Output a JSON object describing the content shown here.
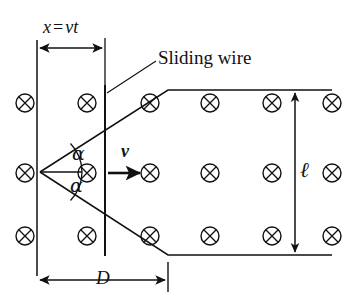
{
  "figure": {
    "background_color": "#ffffff",
    "line_color": "#111111"
  },
  "labels": {
    "sliding_wire": "Sliding wire",
    "displacement_symbol": "x",
    "displacement_equals": "=",
    "displacement_value": "vt",
    "angle_upper": "α",
    "angle_lower": "α",
    "velocity": "v",
    "length": "ℓ",
    "separation": "D"
  },
  "field": {
    "symbol": "⊗",
    "meaning": "magnetic-field-into-page",
    "rows": 3,
    "columns": 6,
    "marker_radius": 9,
    "positions": [
      {
        "x": 25,
        "y": 103
      },
      {
        "x": 87,
        "y": 103
      },
      {
        "x": 150,
        "y": 103
      },
      {
        "x": 210,
        "y": 103
      },
      {
        "x": 272,
        "y": 103
      },
      {
        "x": 332,
        "y": 103
      },
      {
        "x": 25,
        "y": 173
      },
      {
        "x": 87,
        "y": 173
      },
      {
        "x": 150,
        "y": 173
      },
      {
        "x": 210,
        "y": 173
      },
      {
        "x": 272,
        "y": 173
      },
      {
        "x": 332,
        "y": 173
      },
      {
        "x": 25,
        "y": 236
      },
      {
        "x": 87,
        "y": 236
      },
      {
        "x": 150,
        "y": 236
      },
      {
        "x": 210,
        "y": 236
      },
      {
        "x": 272,
        "y": 236
      },
      {
        "x": 332,
        "y": 236
      }
    ]
  },
  "geometry": {
    "left_boundary_line": {
      "x": 37,
      "y1": 40,
      "y2": 276
    },
    "sliding_wire_line": {
      "x": 105,
      "y1": 85,
      "y2": 256
    },
    "apex": {
      "x": 40,
      "y": 172
    },
    "upper_rail": [
      [
        40,
        172
      ],
      [
        168,
        90
      ],
      [
        332,
        90
      ]
    ],
    "lower_rail": [
      [
        40,
        172
      ],
      [
        168,
        255
      ],
      [
        332,
        255
      ]
    ],
    "bisector": {
      "x1": 40,
      "y1": 172,
      "x2": 82,
      "y2": 172
    },
    "velocity_arrow": {
      "x1": 108,
      "y1": 173,
      "x2": 141,
      "y2": 173
    },
    "dimension_x": {
      "x1": 37,
      "x2": 105,
      "y": 48
    },
    "dimension_D": {
      "x1": 37,
      "x2": 168,
      "y": 280
    },
    "dimension_ell": {
      "x": 295,
      "y1": 90,
      "y2": 255
    },
    "leader_sliding_wire": {
      "x1": 107,
      "y1": 93,
      "x2": 156,
      "y2": 61
    }
  }
}
